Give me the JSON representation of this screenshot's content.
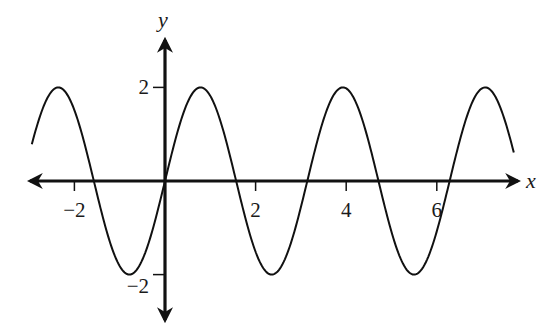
{
  "chart_data": {
    "type": "line",
    "title": "",
    "function": "y = 2 sin(2x)",
    "xlabel": "x",
    "ylabel": "y",
    "xlim": [
      -2.94,
      7.7
    ],
    "ylim": [
      -2,
      2
    ],
    "x_ticks": [
      -2,
      2,
      4,
      6
    ],
    "x_tick_labels": [
      "−2",
      "2",
      "4",
      "6"
    ],
    "y_ticks": [
      2,
      -2
    ],
    "y_tick_labels": [
      "2",
      "−2"
    ],
    "grid": false,
    "legend": null,
    "amplitude": 2,
    "period": 3.1416,
    "peaks_x": [
      -2.36,
      0.785,
      3.93,
      7.07
    ],
    "troughs_x": [
      -0.785,
      2.36,
      5.5
    ],
    "zeros_x": [
      -1.571,
      0,
      1.571,
      3.142,
      4.712,
      6.283
    ],
    "series": [
      {
        "name": "2 sin(2x)",
        "x": [
          -2.94,
          -2.36,
          -1.571,
          -0.785,
          0,
          0.785,
          1.571,
          2.356,
          3.142,
          3.927,
          4.712,
          5.498,
          6.283,
          7.069,
          7.7
        ],
        "y": [
          0.78,
          2,
          0,
          -2,
          0,
          2,
          0,
          -2,
          0,
          2,
          0,
          -2,
          0,
          2,
          0.45
        ]
      }
    ]
  }
}
